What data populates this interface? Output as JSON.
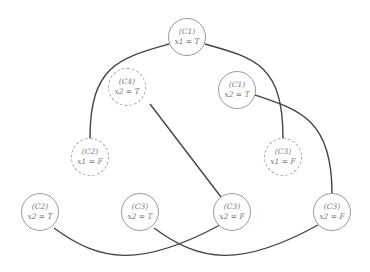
{
  "diagram": {
    "colors": {
      "edge": "#444444",
      "node_border": "#9a9a9a",
      "text": "#777777"
    },
    "nodes": [
      {
        "id": "n0",
        "x": 187,
        "y": 37,
        "style": "solid",
        "clause": "(C1)",
        "assign": "x1 = T"
      },
      {
        "id": "n1",
        "x": 127,
        "y": 87,
        "style": "dashed",
        "clause": "(C4)",
        "assign": "x2 = T"
      },
      {
        "id": "n2",
        "x": 237,
        "y": 90,
        "style": "solid",
        "clause": "(C1)",
        "assign": "x2 = T"
      },
      {
        "id": "n3",
        "x": 90,
        "y": 157,
        "style": "dashed",
        "clause": "(C2)",
        "assign": "x1 = F"
      },
      {
        "id": "n4",
        "x": 283,
        "y": 157,
        "style": "dashed",
        "clause": "(C3)",
        "assign": "x1 = F"
      },
      {
        "id": "n5",
        "x": 40,
        "y": 212,
        "style": "solid",
        "clause": "(C2)",
        "assign": "x2 = T"
      },
      {
        "id": "n6",
        "x": 140,
        "y": 212,
        "style": "solid",
        "clause": "(C3)",
        "assign": "x2 = T"
      },
      {
        "id": "n7",
        "x": 232,
        "y": 212,
        "style": "solid",
        "clause": "(C3)",
        "assign": "x2 = F"
      },
      {
        "id": "n8",
        "x": 332,
        "y": 212,
        "style": "solid",
        "clause": "(C3)",
        "assign": "x2 = F"
      }
    ],
    "edges": [
      {
        "from": "n0",
        "to": "n3"
      },
      {
        "from": "n0",
        "to": "n4"
      },
      {
        "from": "n1",
        "to": "n7"
      },
      {
        "from": "n2",
        "to": "n8"
      },
      {
        "from": "n5",
        "to": "n7"
      },
      {
        "from": "n6",
        "to": "n8"
      }
    ]
  }
}
